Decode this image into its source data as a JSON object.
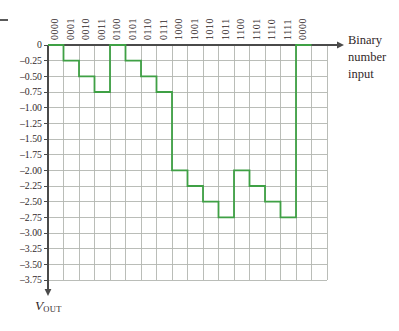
{
  "chart_data": {
    "type": "step-staircase",
    "categories": [
      "0000",
      "0001",
      "0010",
      "0011",
      "0100",
      "0101",
      "0110",
      "0111",
      "1000",
      "1001",
      "1010",
      "1011",
      "1100",
      "1101",
      "1110",
      "1111",
      "0000"
    ],
    "values": [
      0,
      -0.25,
      -0.5,
      -0.75,
      0,
      -0.25,
      -0.5,
      -0.75,
      -2.0,
      -2.25,
      -2.5,
      -2.75,
      -2.0,
      -2.25,
      -2.5,
      -2.75,
      0
    ],
    "y_tick_labels": [
      "0",
      "–0.25",
      "–0.50",
      "–0.75",
      "–1.00",
      "–1.25",
      "–1.50",
      "–1.75",
      "–2.00",
      "–2.25",
      "–2.50",
      "–2.75",
      "–3.00",
      "–3.25",
      "–3.50",
      "–3.75"
    ],
    "y_tick_values": [
      0,
      -0.25,
      -0.5,
      -0.75,
      -1.0,
      -1.25,
      -1.5,
      -1.75,
      -2.0,
      -2.25,
      -2.5,
      -2.75,
      -3.0,
      -3.25,
      -3.5,
      -3.75
    ],
    "ylim": [
      0,
      -3.75
    ],
    "grid": true,
    "legend": "none",
    "xlabel_lines": [
      "Binary",
      "number",
      "input"
    ],
    "ylabel": {
      "variable": "V",
      "subscript": "OUT"
    },
    "colors": {
      "line": "#3fa045",
      "grid": "#b3b6b0",
      "axis": "#4a4a4a",
      "text": "#32282a"
    }
  }
}
